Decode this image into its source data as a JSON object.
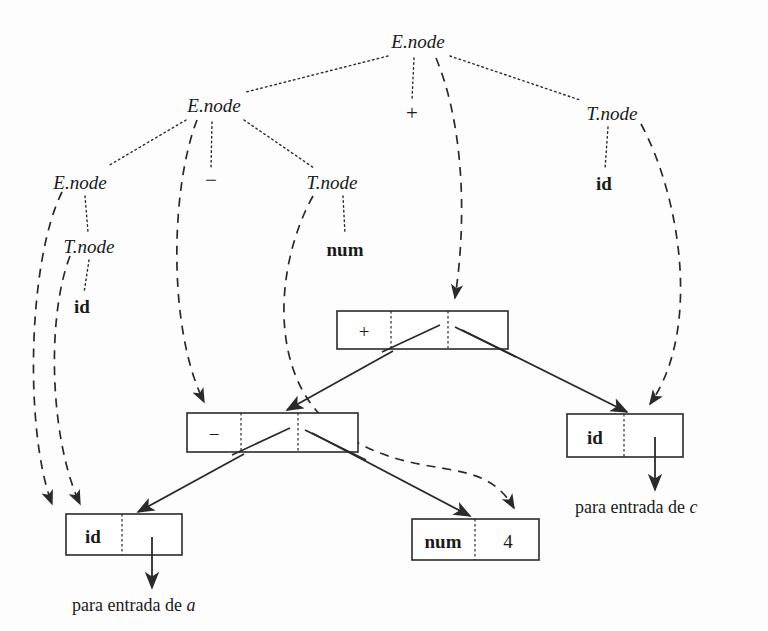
{
  "figure": {
    "background_color": "#fdfdfd",
    "ink_color": "#1a1a1a"
  },
  "parse_tree": {
    "description": "Arbol de analisis sintactico con atributos .node dibujado con aristas punteadas",
    "nodes": [
      {
        "id": "e0",
        "label": "E.node",
        "kind": "nonterminal",
        "x": 418,
        "y": 42,
        "level": 0
      },
      {
        "id": "e1",
        "label": "E.node",
        "kind": "nonterminal",
        "x": 214,
        "y": 105,
        "level": 1
      },
      {
        "id": "plus",
        "label": "+",
        "kind": "operator",
        "x": 412,
        "y": 114,
        "level": 1
      },
      {
        "id": "t1",
        "label": "T.node",
        "kind": "nonterminal",
        "x": 612,
        "y": 113,
        "level": 1
      },
      {
        "id": "e2",
        "label": "E.node",
        "kind": "nonterminal",
        "x": 80,
        "y": 182,
        "level": 2
      },
      {
        "id": "minus",
        "label": "−",
        "kind": "operator",
        "x": 211,
        "y": 180,
        "level": 2
      },
      {
        "id": "t2",
        "label": "T.node",
        "kind": "nonterminal",
        "x": 332,
        "y": 182,
        "level": 2
      },
      {
        "id": "idc",
        "label": "id",
        "kind": "terminal",
        "x": 604,
        "y": 183,
        "level": 2
      },
      {
        "id": "t3",
        "label": "T.node",
        "kind": "nonterminal",
        "x": 89,
        "y": 246,
        "level": 3
      },
      {
        "id": "num",
        "label": "num",
        "kind": "terminal",
        "x": 345,
        "y": 249,
        "level": 3
      },
      {
        "id": "ida",
        "label": "id",
        "kind": "terminal",
        "x": 82,
        "y": 306,
        "level": 4
      }
    ],
    "edges": [
      {
        "from": "e0",
        "to": "e1"
      },
      {
        "from": "e0",
        "to": "plus"
      },
      {
        "from": "e0",
        "to": "t1"
      },
      {
        "from": "e1",
        "to": "e2"
      },
      {
        "from": "e1",
        "to": "minus"
      },
      {
        "from": "e1",
        "to": "t2"
      },
      {
        "from": "e2",
        "to": "t3"
      },
      {
        "from": "t2",
        "to": "num"
      },
      {
        "from": "t3",
        "to": "ida"
      },
      {
        "from": "t1",
        "to": "idc"
      }
    ]
  },
  "dag": {
    "description": "Nodos del DAG construidos, con celdas de operador/operandos y punteros solidos",
    "boxes": [
      {
        "id": "box_plus",
        "x": 337,
        "y": 311,
        "width": 171,
        "height": 38,
        "cells": [
          {
            "text": "+",
            "style": "operator",
            "width_ratio": 0.315
          },
          {
            "text": "",
            "style": "pointer",
            "width_ratio": 0.335
          },
          {
            "text": "",
            "style": "pointer",
            "width_ratio": 0.35
          }
        ]
      },
      {
        "id": "box_minus",
        "x": 187,
        "y": 413,
        "width": 171,
        "height": 39,
        "cells": [
          {
            "text": "−",
            "style": "operator",
            "width_ratio": 0.315
          },
          {
            "text": "",
            "style": "pointer",
            "width_ratio": 0.335
          },
          {
            "text": "",
            "style": "pointer",
            "width_ratio": 0.35
          }
        ]
      },
      {
        "id": "box_id_a",
        "x": 66,
        "y": 514,
        "width": 116,
        "height": 41,
        "cells": [
          {
            "text": "id",
            "style": "terminal",
            "width_ratio": 0.48
          },
          {
            "text": "",
            "style": "pointer",
            "width_ratio": 0.52
          }
        ]
      },
      {
        "id": "box_num_4",
        "x": 412,
        "y": 519,
        "width": 127,
        "height": 41,
        "cells": [
          {
            "text": "num",
            "style": "terminal",
            "width_ratio": 0.5
          },
          {
            "text": "4",
            "style": "value",
            "width_ratio": 0.5
          }
        ]
      },
      {
        "id": "box_id_c",
        "x": 567,
        "y": 414,
        "width": 116,
        "height": 43,
        "cells": [
          {
            "text": "id",
            "style": "terminal",
            "width_ratio": 0.49
          },
          {
            "text": "",
            "style": "pointer",
            "width_ratio": 0.51
          }
        ]
      }
    ],
    "child_links": [
      {
        "from": "box_plus",
        "to": "box_minus",
        "label": "puntero-izquierdo"
      },
      {
        "from": "box_plus",
        "to": "box_id_c",
        "label": "puntero-derecho"
      },
      {
        "from": "box_minus",
        "to": "box_id_a",
        "label": "puntero-izquierdo"
      },
      {
        "from": "box_minus",
        "to": "box_num_4",
        "label": "puntero-derecho"
      }
    ],
    "attribute_pointers": [
      {
        "from": "e0",
        "to": "box_plus"
      },
      {
        "from": "e1",
        "to": "box_minus"
      },
      {
        "from": "e2",
        "to": "box_id_a"
      },
      {
        "from": "t3",
        "to": "box_id_a"
      },
      {
        "from": "t2",
        "to": "box_num_4"
      },
      {
        "from": "t1",
        "to": "box_id_c"
      }
    ]
  },
  "captions": [
    {
      "id": "caption_a",
      "prefix": "para entrada de ",
      "var": "a",
      "x": 72,
      "y": 611
    },
    {
      "id": "caption_c",
      "prefix": "para entrada de ",
      "var": "c",
      "x": 575,
      "y": 513
    }
  ],
  "symbol_table_arrows": [
    {
      "from_box": "box_id_a",
      "to_caption": "caption_a"
    },
    {
      "from_box": "box_id_c",
      "to_caption": "caption_c"
    }
  ]
}
